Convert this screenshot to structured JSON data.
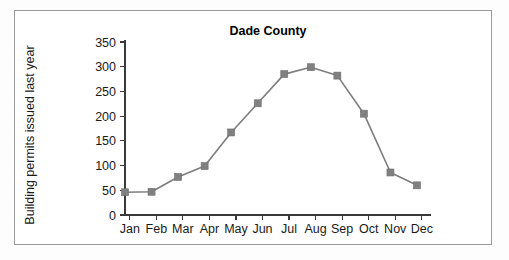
{
  "chart_data": {
    "type": "line",
    "title": "Dade County",
    "xlabel": "",
    "ylabel": "Building permits issued last year",
    "categories": [
      "Jan",
      "Feb",
      "Mar",
      "Apr",
      "May",
      "Jun",
      "Jul",
      "Aug",
      "Sep",
      "Oct",
      "Nov",
      "Dec"
    ],
    "values": [
      46,
      47,
      77,
      99,
      167,
      226,
      285,
      299,
      282,
      205,
      86,
      60
    ],
    "series": [
      {
        "name": "Building permits issued last year",
        "values": [
          46,
          47,
          77,
          99,
          167,
          226,
          285,
          299,
          282,
          205,
          86,
          60
        ]
      }
    ],
    "ylim": [
      0,
      350
    ],
    "ytick_step": 50,
    "yticks": [
      0,
      50,
      100,
      150,
      200,
      250,
      300,
      350
    ],
    "ytick_labels": [
      "0",
      "50",
      "100",
      "150",
      "200",
      "250",
      "300",
      "350"
    ],
    "grid": false,
    "legend": false,
    "legend_position": "none",
    "marker": "square",
    "colors": {
      "line": "#7d7d7d",
      "marker": "#808080",
      "axis": "#3a3a3a",
      "text": "#1a1a1a",
      "frame": "#9a9a9a",
      "background": "#ffffff"
    }
  }
}
